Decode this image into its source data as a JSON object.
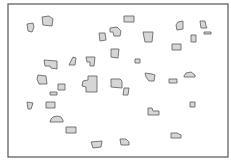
{
  "diagram": {
    "type": "building-footprint-map",
    "frame": {
      "x": 8,
      "y": 4,
      "width": 220,
      "height": 153
    },
    "colors": {
      "fill": "#d6d6d6",
      "stroke": "#6a6a6a",
      "frame": "#555555",
      "background": "#ffffff"
    },
    "shapes": [
      {
        "id": "A",
        "points": "27,24 33,23 34,27 32,32 28,31"
      },
      {
        "id": "B",
        "points": "42,17 49,16 53,19 52,26 43,25"
      },
      {
        "id": "C",
        "points": "124,16 134,16 134,22 124,22"
      },
      {
        "id": "D",
        "points": "110,28 117,27 121,31 120,36 114,36 113,32 110,32"
      },
      {
        "id": "E",
        "points": "99,33 105,33 106,40 100,41"
      },
      {
        "id": "F",
        "points": "143,32 153,32 152,42 145,42"
      },
      {
        "id": "G",
        "points": "178,22 183,21 183,29 177,30 176,25"
      },
      {
        "id": "H",
        "points": "200,21 205,21 206,26 207,28 201,28"
      },
      {
        "id": "I",
        "points": "204,32 211,32 211,34 204,34"
      },
      {
        "id": "J",
        "points": "191,35 196,35 196,42 191,42"
      },
      {
        "id": "K",
        "points": "172,44 181,44 181,50 172,50"
      },
      {
        "id": "L",
        "points": "111,49 119,49 118,58 111,57"
      },
      {
        "id": "M",
        "points": "44,60 57,61 57,69 51,68 50,66 45,66"
      },
      {
        "id": "N",
        "points": "73,57 76,58 75,65 69,65 71,61"
      },
      {
        "id": "O",
        "points": "86,57 95,57 94,66 90,66 90,62 87,62"
      },
      {
        "id": "P",
        "points": "135,59 140,59 140,63 135,63"
      },
      {
        "id": "Q",
        "points": "38,75 46,76 47,84 39,84 37,79"
      },
      {
        "id": "R",
        "points": "58,84 65,84 65,90 58,90"
      },
      {
        "id": "S",
        "points": "88,76 97,76 97,92 86,92 86,87 82,86 83,81 88,80"
      },
      {
        "id": "T",
        "points": "111,79 120,79 122,81 122,88 111,87"
      },
      {
        "id": "U",
        "points": "124,88 129,88 128,95 123,95"
      },
      {
        "id": "V",
        "points": "145,73 152,74 155,75 154,81 149,81 146,77"
      },
      {
        "id": "W",
        "points": "169,79 177,79 177,83 169,83"
      },
      {
        "id": "X",
        "points": "184,76 186,73 191,72 195,75 195,77 184,77"
      },
      {
        "id": "Y",
        "points": "50,92 57,92 57,95 50,95"
      },
      {
        "id": "Z",
        "points": "27,102 33,103 31,109 28,109"
      },
      {
        "id": "AA",
        "points": "46,102 55,102 55,108 46,108"
      },
      {
        "id": "AB",
        "points": "190,102 195,102 195,107 190,107"
      },
      {
        "id": "AC",
        "points": "148,108 152,108 153,111 159,111 159,115 148,115"
      },
      {
        "id": "AD",
        "points": "51,119 53,117 57,116 61,117 63,120 63,122 50,122"
      },
      {
        "id": "AE",
        "points": "66,127 76,127 76,133 66,133"
      },
      {
        "id": "AF",
        "points": "171,133 177,133 181,135 181,138 171,138"
      },
      {
        "id": "AG",
        "points": "91,142 102,141 101,147 93,148"
      },
      {
        "id": "AH",
        "points": "120,139 126,139 129,142 129,145 121,145"
      }
    ]
  }
}
